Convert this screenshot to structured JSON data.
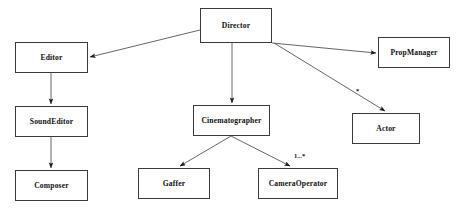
{
  "diagram": {
    "type": "uml-class-diagram",
    "background_color": "#ffffff",
    "box_border_color": "#3a3a3a",
    "edge_color": "#555555",
    "text_color": "#101010",
    "nodes": [
      {
        "id": "director",
        "label": "Director",
        "x": 200,
        "y": 8,
        "w": 72,
        "h": 35
      },
      {
        "id": "editor",
        "label": "Editor",
        "x": 15,
        "y": 42,
        "w": 73,
        "h": 31
      },
      {
        "id": "propmanager",
        "label": "PropManager",
        "x": 378,
        "y": 37,
        "w": 72,
        "h": 31
      },
      {
        "id": "soundeditor",
        "label": "SoundEditor",
        "x": 15,
        "y": 106,
        "w": 73,
        "h": 31
      },
      {
        "id": "cinematographer",
        "label": "Cinematographer",
        "x": 193,
        "y": 105,
        "w": 77,
        "h": 31
      },
      {
        "id": "actor",
        "label": "Actor",
        "x": 352,
        "y": 113,
        "w": 68,
        "h": 31
      },
      {
        "id": "composer",
        "label": "Composer",
        "x": 15,
        "y": 170,
        "w": 73,
        "h": 31
      },
      {
        "id": "gaffer",
        "label": "Gaffer",
        "x": 138,
        "y": 168,
        "w": 72,
        "h": 31
      },
      {
        "id": "cameraoperator",
        "label": "CameraOperator",
        "x": 258,
        "y": 168,
        "w": 80,
        "h": 31
      }
    ],
    "edges": [
      {
        "id": "director-editor",
        "from": "director",
        "to": "editor",
        "x1": 200,
        "y1": 30,
        "x2": 90,
        "y2": 57,
        "label": ""
      },
      {
        "id": "director-propmanager",
        "from": "director",
        "to": "propmanager",
        "x1": 272,
        "y1": 43,
        "x2": 376,
        "y2": 53,
        "label": ""
      },
      {
        "id": "director-cinematographer",
        "from": "director",
        "to": "cinematographer",
        "x1": 232,
        "y1": 43,
        "x2": 232,
        "y2": 103,
        "label": ""
      },
      {
        "id": "director-actor",
        "from": "director",
        "to": "actor",
        "x1": 274,
        "y1": 43,
        "x2": 385,
        "y2": 111,
        "label": "*"
      },
      {
        "id": "editor-soundeditor",
        "from": "editor",
        "to": "soundeditor",
        "x1": 51,
        "y1": 73,
        "x2": 51,
        "y2": 104,
        "label": ""
      },
      {
        "id": "soundeditor-composer",
        "from": "soundeditor",
        "to": "composer",
        "x1": 51,
        "y1": 137,
        "x2": 51,
        "y2": 168,
        "label": ""
      },
      {
        "id": "cinematographer-gaffer",
        "from": "cinematographer",
        "to": "gaffer",
        "x1": 231,
        "y1": 136,
        "x2": 180,
        "y2": 166,
        "label": ""
      },
      {
        "id": "cinematographer-cameraoperator",
        "from": "cinematographer",
        "to": "cameraoperator",
        "x1": 231,
        "y1": 136,
        "x2": 290,
        "y2": 166,
        "label": "1...*"
      }
    ],
    "edge_labels": [
      {
        "id": "actor-multiplicity",
        "text": "*",
        "x": 356,
        "y": 88
      },
      {
        "id": "cameraoperator-multiplicity",
        "text": "1...*",
        "x": 294,
        "y": 153
      }
    ]
  }
}
